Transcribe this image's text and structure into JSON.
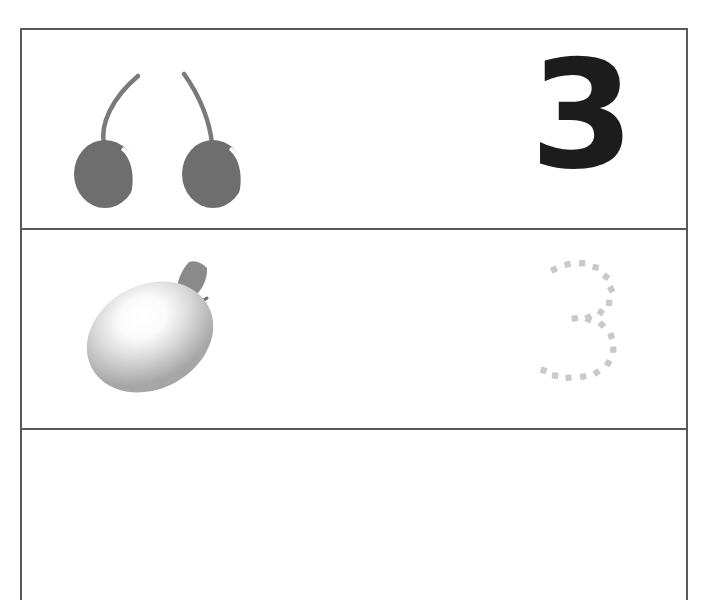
{
  "worksheet": {
    "title": "Number tracing worksheet",
    "numeral": "3",
    "numeral_value": 3,
    "rows": [
      {
        "id": "row-example",
        "fruit": "cherries",
        "fruit_count": 2,
        "numeral_style": "solid",
        "numeral": "3"
      },
      {
        "id": "row-trace",
        "fruit": "mango",
        "fruit_count": 1,
        "numeral_style": "dotted",
        "numeral": "3"
      },
      {
        "id": "row-blank",
        "fruit": "",
        "fruit_count": 0,
        "numeral_style": "blank",
        "numeral": ""
      }
    ]
  },
  "colors": {
    "border": "#595959",
    "numeral_solid": "#1c1c1c",
    "numeral_dotted": "#c9c9c9",
    "cherry_body": "#6e6e6e",
    "cherry_stem": "#7a7a7a",
    "cherry_highlight": "#ffffff",
    "mango_light": "#ffffff",
    "mango_mid": "#d8d8d8",
    "mango_dark": "#9e9e9e",
    "leaf": "#8a8a8a",
    "page_background": "#ffffff"
  },
  "dotted_path_dashes": [
    {
      "x": 13,
      "y": 10,
      "r": -26
    },
    {
      "x": 26,
      "y": 5,
      "r": -14
    },
    {
      "x": 40,
      "y": 4,
      "r": -2
    },
    {
      "x": 53,
      "y": 8,
      "r": 14
    },
    {
      "x": 63,
      "y": 17,
      "r": 36
    },
    {
      "x": 68,
      "y": 29,
      "r": 62
    },
    {
      "x": 66,
      "y": 42,
      "r": 96
    },
    {
      "x": 58,
      "y": 51,
      "r": 124
    },
    {
      "x": 46,
      "y": 56,
      "r": 152
    },
    {
      "x": 33,
      "y": 57,
      "r": 170
    },
    {
      "x": 46,
      "y": 58,
      "r": 20
    },
    {
      "x": 59,
      "y": 63,
      "r": 44
    },
    {
      "x": 68,
      "y": 74,
      "r": 72
    },
    {
      "x": 70,
      "y": 87,
      "r": 92
    },
    {
      "x": 65,
      "y": 100,
      "r": 118
    },
    {
      "x": 54,
      "y": 109,
      "r": 145
    },
    {
      "x": 41,
      "y": 113,
      "r": 166
    },
    {
      "x": 27,
      "y": 114,
      "r": 176
    },
    {
      "x": 14,
      "y": 112,
      "r": 186
    },
    {
      "x": 3,
      "y": 107,
      "r": 200
    }
  ]
}
